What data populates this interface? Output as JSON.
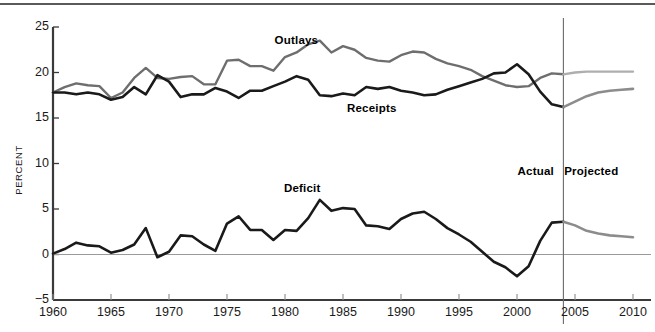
{
  "chart_data": {
    "type": "line",
    "title": "",
    "subtitle": "",
    "xlabel": "",
    "ylabel": "PERCENT",
    "xlim": [
      1960,
      2010
    ],
    "ylim": [
      -5,
      25
    ],
    "grid": false,
    "legend_position": "inline-annotations",
    "x_ticks": [
      1960,
      1965,
      1970,
      1975,
      1980,
      1985,
      1990,
      1995,
      2000,
      2005,
      2010
    ],
    "y_ticks": [
      -5,
      0,
      5,
      10,
      15,
      20,
      25
    ],
    "x_tick_labels": [
      "1960",
      "1965",
      "1970",
      "1975",
      "1980",
      "1985",
      "1990",
      "1995",
      "2000",
      "2005",
      "2010"
    ],
    "y_tick_labels": [
      "−5",
      "0",
      "5",
      "10",
      "15",
      "20",
      "25"
    ],
    "zero_line": 0,
    "actual_projected_divider": 2004,
    "annotations": [
      {
        "text": "Outlays",
        "x": 1981,
        "y": 23.4
      },
      {
        "text": "Receipts",
        "x": 1987.5,
        "y": 15.9
      },
      {
        "text": "Deficit",
        "x": 1981.5,
        "y": 7.1
      },
      {
        "text": "Actual",
        "x": 2001.6,
        "y": 9.0
      },
      {
        "text": "Projected",
        "x": 2006.4,
        "y": 9.0
      }
    ],
    "x": [
      1960,
      1961,
      1962,
      1963,
      1964,
      1965,
      1966,
      1967,
      1968,
      1969,
      1970,
      1971,
      1972,
      1973,
      1974,
      1975,
      1976,
      1977,
      1978,
      1979,
      1980,
      1981,
      1982,
      1983,
      1984,
      1985,
      1986,
      1987,
      1988,
      1989,
      1990,
      1991,
      1992,
      1993,
      1994,
      1995,
      1996,
      1997,
      1998,
      1999,
      2000,
      2001,
      2002,
      2003,
      2004,
      2005,
      2006,
      2007,
      2008,
      2009,
      2010
    ],
    "series": [
      {
        "name": "Outlays",
        "color": "#6e6e6e",
        "projected_color": "#aeaeae",
        "values": [
          17.8,
          18.4,
          18.8,
          18.6,
          18.5,
          17.2,
          17.8,
          19.4,
          20.5,
          19.4,
          19.3,
          19.5,
          19.6,
          18.7,
          18.7,
          21.3,
          21.4,
          20.7,
          20.7,
          20.2,
          21.7,
          22.2,
          23.1,
          23.5,
          22.2,
          22.9,
          22.5,
          21.6,
          21.3,
          21.2,
          21.9,
          22.3,
          22.2,
          21.5,
          21.0,
          20.7,
          20.3,
          19.6,
          19.1,
          18.6,
          18.4,
          18.5,
          19.4,
          19.9,
          19.8,
          20.0,
          20.1,
          20.1,
          20.1,
          20.1,
          20.1
        ],
        "last_actual_index": 44
      },
      {
        "name": "Receipts",
        "color": "#1a1a1a",
        "projected_color": "#8c8c8c",
        "values": [
          17.8,
          17.8,
          17.6,
          17.8,
          17.6,
          17.0,
          17.3,
          18.4,
          17.6,
          19.7,
          19.0,
          17.3,
          17.6,
          17.6,
          18.3,
          17.9,
          17.2,
          18.0,
          18.0,
          18.5,
          19.0,
          19.6,
          19.2,
          17.5,
          17.4,
          17.7,
          17.5,
          18.4,
          18.2,
          18.4,
          18.0,
          17.8,
          17.5,
          17.6,
          18.1,
          18.5,
          18.9,
          19.3,
          19.9,
          20.0,
          20.9,
          19.8,
          17.9,
          16.5,
          16.2,
          16.8,
          17.4,
          17.8,
          18.0,
          18.1,
          18.2
        ],
        "last_actual_index": 44
      },
      {
        "name": "Deficit",
        "color": "#1a1a1a",
        "projected_color": "#8c8c8c",
        "values": [
          0.1,
          0.6,
          1.3,
          1.0,
          0.9,
          0.2,
          0.5,
          1.1,
          2.9,
          -0.3,
          0.3,
          2.1,
          2.0,
          1.1,
          0.4,
          3.4,
          4.2,
          2.7,
          2.7,
          1.6,
          2.7,
          2.6,
          4.0,
          6.0,
          4.8,
          5.1,
          5.0,
          3.2,
          3.1,
          2.8,
          3.9,
          4.5,
          4.7,
          3.9,
          2.9,
          2.2,
          1.4,
          0.3,
          -0.8,
          -1.4,
          -2.4,
          -1.3,
          1.5,
          3.5,
          3.6,
          3.2,
          2.6,
          2.3,
          2.1,
          2.0,
          1.9
        ],
        "last_actual_index": 44
      }
    ]
  },
  "axis": {
    "y_title": "PERCENT"
  },
  "labels": {
    "outlays": "Outlays",
    "receipts": "Receipts",
    "deficit": "Deficit",
    "actual": "Actual",
    "projected": "Projected"
  },
  "x_tick_labels": [
    "1960",
    "1965",
    "1970",
    "1975",
    "1980",
    "1985",
    "1990",
    "1995",
    "2000",
    "2005",
    "2010"
  ],
  "y_tick_labels": [
    "25",
    "20",
    "15",
    "10",
    "5",
    "0",
    "−5"
  ],
  "colors": {
    "outlays": "#6e6e6e",
    "outlays_projected": "#aeaeae",
    "receipts": "#1a1a1a",
    "receipts_projected": "#8c8c8c",
    "deficit": "#1a1a1a",
    "deficit_projected": "#8c8c8c",
    "axis": "#3a3a3a",
    "zero_line": "#9a9a9a",
    "divider": "#6a6a6a"
  }
}
